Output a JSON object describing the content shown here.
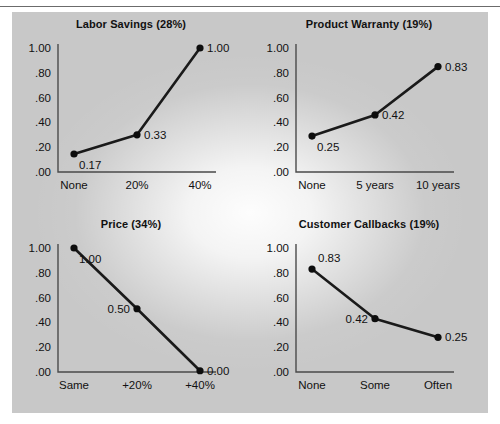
{
  "figure": {
    "background_color": "#c8c8c8",
    "axis_color": "#4a4a4a",
    "line_color": "#1a1a1a",
    "text_color": "#111111"
  },
  "chart_data": [
    {
      "type": "line",
      "title": "Labor Savings (28%)",
      "xlabel": "",
      "ylabel": "",
      "categories": [
        "None",
        "20%",
        "40%"
      ],
      "values": [
        0.17,
        0.33,
        1.0
      ],
      "plotted_values": [
        0.145,
        0.3,
        1.0
      ],
      "point_labels": [
        "0.17",
        "0.33",
        "1.00"
      ],
      "label_positions": [
        "below-right",
        "right",
        "right"
      ],
      "ylim": [
        0.0,
        1.0
      ],
      "yticks": [
        0.0,
        0.2,
        0.4,
        0.6,
        0.8,
        1.0
      ],
      "ytick_labels": [
        ".00",
        ".20",
        ".40",
        ".60",
        ".80",
        "1.00"
      ],
      "grid": false,
      "legend": "none"
    },
    {
      "type": "line",
      "title": "Product Warranty (19%)",
      "xlabel": "",
      "ylabel": "",
      "categories": [
        "None",
        "5 years",
        "10 years"
      ],
      "values": [
        0.25,
        0.42,
        0.83
      ],
      "plotted_values": [
        0.29,
        0.46,
        0.85
      ],
      "point_labels": [
        "0.25",
        "0.42",
        "0.83"
      ],
      "label_positions": [
        "below-right",
        "right",
        "right"
      ],
      "ylim": [
        0.0,
        1.0
      ],
      "yticks": [
        0.0,
        0.2,
        0.4,
        0.6,
        0.8,
        1.0
      ],
      "ytick_labels": [
        ".00",
        ".20",
        ".40",
        ".60",
        ".80",
        "1.00"
      ],
      "grid": false,
      "legend": "none"
    },
    {
      "type": "line",
      "title": "Price (34%)",
      "xlabel": "",
      "ylabel": "",
      "categories": [
        "Same",
        "+20%",
        "+40%"
      ],
      "values": [
        1.0,
        0.5,
        0.0
      ],
      "plotted_values": [
        1.0,
        0.51,
        0.01
      ],
      "point_labels": [
        "1.00",
        "0.50",
        "0.00"
      ],
      "label_positions": [
        "below-right",
        "left",
        "right"
      ],
      "ylim": [
        0.0,
        1.0
      ],
      "yticks": [
        0.0,
        0.2,
        0.4,
        0.6,
        0.8,
        1.0
      ],
      "ytick_labels": [
        ".00",
        ".20",
        ".40",
        ".60",
        ".80",
        "1.00"
      ],
      "grid": false,
      "legend": "none"
    },
    {
      "type": "line",
      "title": "Customer Callbacks (19%)",
      "xlabel": "",
      "ylabel": "",
      "categories": [
        "None",
        "Some",
        "Often"
      ],
      "values": [
        0.83,
        0.42,
        0.25
      ],
      "plotted_values": [
        0.83,
        0.43,
        0.28
      ],
      "point_labels": [
        "0.83",
        "0.42",
        "0.25"
      ],
      "label_positions": [
        "above-right",
        "left",
        "right"
      ],
      "ylim": [
        0.0,
        1.0
      ],
      "yticks": [
        0.0,
        0.2,
        0.4,
        0.6,
        0.8,
        1.0
      ],
      "ytick_labels": [
        ".00",
        ".20",
        ".40",
        ".60",
        ".80",
        "1.00"
      ],
      "grid": false,
      "legend": "none"
    }
  ]
}
